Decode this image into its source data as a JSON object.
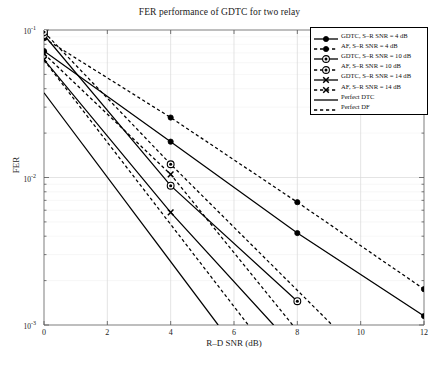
{
  "chart_data": {
    "type": "line",
    "title": "FER performance of GDTC for two relay",
    "xlabel": "R–D SNR (dB)",
    "ylabel": "FER",
    "xlim": [
      0,
      12
    ],
    "ylim": [
      0.001,
      0.1
    ],
    "yscale": "log",
    "xticks": [
      0,
      2,
      4,
      6,
      8,
      10,
      12
    ],
    "xticklabels": [
      "0",
      "2",
      "4",
      "6",
      "8",
      "10",
      "12"
    ],
    "yticks": [
      0.001,
      0.01,
      0.1
    ],
    "yticklabels": [
      "10⁻³",
      "10⁻²",
      "10⁻¹"
    ],
    "grid": true,
    "legend_position": "upper right",
    "series": [
      {
        "name": "GDTC, S–R SNR = 4 dB",
        "style": "solid",
        "marker": "filled-circle",
        "color": "#000000",
        "x": [
          0,
          4,
          8,
          12
        ],
        "y": [
          0.072,
          0.0175,
          0.0042,
          0.00115
        ],
        "marker_x": [
          0,
          4,
          8,
          12
        ]
      },
      {
        "name": "AF, S–R SNR = 4 dB",
        "style": "dashed",
        "marker": "filled-circle",
        "color": "#000000",
        "x": [
          0,
          4,
          8,
          12
        ],
        "y": [
          0.088,
          0.0255,
          0.0068,
          0.00175
        ],
        "marker_x": [
          0,
          4,
          8,
          12
        ]
      },
      {
        "name": "GDTC, S–R SNR = 10 dB",
        "style": "solid",
        "marker": "open-circle",
        "color": "#000000",
        "x": [
          0,
          4,
          8
        ],
        "y": [
          0.0925,
          0.0088,
          0.00145
        ],
        "marker_x": [
          0,
          4,
          8
        ]
      },
      {
        "name": "AF, S–R SNR = 10 dB",
        "style": "dashed",
        "marker": "open-circle",
        "color": "#000000",
        "x": [
          0,
          4,
          9.1
        ],
        "y": [
          0.097,
          0.0123,
          0.001
        ],
        "marker_x": [
          0,
          4
        ]
      },
      {
        "name": "GDTC, S–R SNR = 14 dB",
        "style": "solid",
        "marker": "x-cross",
        "color": "#000000",
        "x": [
          0,
          4,
          7.25
        ],
        "y": [
          0.063,
          0.0058,
          0.001
        ],
        "marker_x": [
          0,
          4
        ]
      },
      {
        "name": "AF, S–R SNR = 14 dB",
        "style": "dashed",
        "marker": "x-cross",
        "color": "#000000",
        "x": [
          0,
          4,
          7.85
        ],
        "y": [
          0.069,
          0.0105,
          0.001
        ],
        "marker_x": [
          0,
          4
        ]
      },
      {
        "name": "Perfect DTC",
        "style": "solid",
        "marker": "none",
        "color": "#000000",
        "x": [
          0,
          5.5
        ],
        "y": [
          0.0375,
          0.001
        ],
        "marker_x": []
      },
      {
        "name": "Perfect DF",
        "style": "dashed",
        "marker": "none",
        "color": "#000000",
        "x": [
          0,
          6.45
        ],
        "y": [
          0.0625,
          0.001
        ],
        "marker_x": []
      }
    ]
  },
  "legend": {
    "entries": [
      {
        "label": "GDTC, S–R SNR = 4 dB"
      },
      {
        "label": "AF, S–R SNR = 4 dB"
      },
      {
        "label": "GDTC, S–R SNR = 10 dB"
      },
      {
        "label": "AF, S–R SNR = 10 dB"
      },
      {
        "label": "GDTC, S–R SNR = 14 dB"
      },
      {
        "label": "AF, S–R SNR = 14 dB"
      },
      {
        "label": "Perfect DTC"
      },
      {
        "label": "Perfect DF"
      }
    ]
  },
  "axes": {
    "x_tick_labels": [
      "0",
      "2",
      "4",
      "6",
      "8",
      "10",
      "12"
    ],
    "y_tick_labels": [
      "10",
      "10",
      "10"
    ],
    "y_tick_exponents": [
      "-1",
      "-2",
      "-3"
    ]
  },
  "colors": {
    "line": "#000000",
    "grid": "#e8e8e8",
    "axis": "#8a8a8a",
    "background": "#ffffff"
  }
}
